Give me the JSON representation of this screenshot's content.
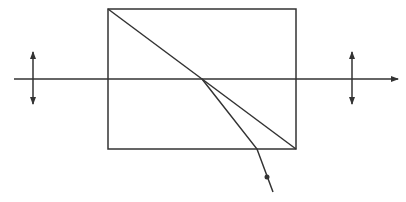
{
  "diagram": {
    "title": "",
    "stroke_color": "#333333",
    "background": "#ffffff",
    "elements": {
      "prism": {
        "x": 108,
        "y": 9,
        "width": 188,
        "height": 140
      },
      "interface_line": {
        "x1": 108,
        "y1": 9,
        "x2": 296,
        "y2": 149
      },
      "optical_axis": {
        "x1": 14,
        "y1": 79,
        "x2": 398,
        "y2": 79
      },
      "input_polarization": {
        "x": 33,
        "y1": 52,
        "y2": 104
      },
      "output_polarization": {
        "x": 352,
        "y1": 52,
        "y2": 104
      },
      "deflected_ray": [
        [
          202,
          79
        ],
        [
          257,
          149
        ],
        [
          273,
          192
        ]
      ],
      "deflected_ray_dot": {
        "cx": 267,
        "cy": 177,
        "r": 2.5
      }
    }
  }
}
